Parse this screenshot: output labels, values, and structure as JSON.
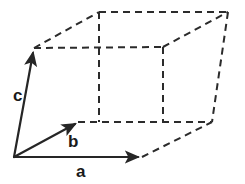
{
  "figure": {
    "background_color": "#ffffff",
    "stroke_color": "#262626",
    "dashed_stroke_color": "#2b2b2b",
    "solid_stroke_width": 2.2,
    "dashed_stroke_width": 2.0,
    "dash_pattern": "7,5"
  },
  "labels": {
    "a": "a",
    "b": "b",
    "c": "c"
  },
  "vectors": [
    {
      "name": "a",
      "label": "a",
      "style": "solid",
      "arrow": true,
      "start": {
        "x": 14,
        "y": 157
      },
      "end": {
        "x": 142,
        "y": 157
      },
      "label_position": {
        "x": 76,
        "y": 163
      }
    },
    {
      "name": "b",
      "label": "b",
      "style": "solid",
      "arrow": true,
      "start": {
        "x": 14,
        "y": 157
      },
      "end": {
        "x": 78,
        "y": 122
      },
      "label_position": {
        "x": 68,
        "y": 133
      }
    },
    {
      "name": "c",
      "label": "c",
      "style": "solid",
      "arrow": true,
      "start": {
        "x": 14,
        "y": 157
      },
      "end": {
        "x": 34,
        "y": 48
      },
      "label_position": {
        "x": 13,
        "y": 87
      }
    }
  ],
  "vertices": {
    "origin": {
      "x": 14,
      "y": 157
    },
    "a_tip": {
      "x": 142,
      "y": 157
    },
    "b_tip": {
      "x": 78,
      "y": 122
    },
    "c_tip": {
      "x": 34,
      "y": 48
    },
    "a_plus_b": {
      "x": 209,
      "y": 122
    },
    "a_plus_c": {
      "x": 163,
      "y": 47
    },
    "b_plus_c": {
      "x": 99,
      "y": 12
    },
    "a_plus_b_plus_c": {
      "x": 228,
      "y": 12
    }
  },
  "dashed_edges": [
    {
      "name": "edge-ctip-to-ac",
      "from": "c_tip",
      "to": "a_plus_c"
    },
    {
      "name": "edge-ctip-to-bc",
      "from": "c_tip",
      "to": "b_plus_c"
    },
    {
      "name": "edge-bc-to-abc",
      "from": "b_plus_c",
      "to": "a_plus_b_plus_c"
    },
    {
      "name": "edge-ac-to-abc",
      "from": "a_plus_c",
      "to": "a_plus_b_plus_c"
    },
    {
      "name": "edge-btip-to-ab",
      "from": "b_tip",
      "to": "a_plus_b"
    },
    {
      "name": "edge-atip-to-ab",
      "from": "a_tip",
      "to": "a_plus_b"
    },
    {
      "name": "edge-bc-to-btip",
      "from": "b_plus_c",
      "to": "b_tip"
    },
    {
      "name": "edge-ac-to-atip",
      "from": "a_plus_c",
      "to": "a_tip"
    },
    {
      "name": "edge-abc-to-ab",
      "from": "a_plus_b_plus_c",
      "to": "a_plus_b"
    }
  ]
}
